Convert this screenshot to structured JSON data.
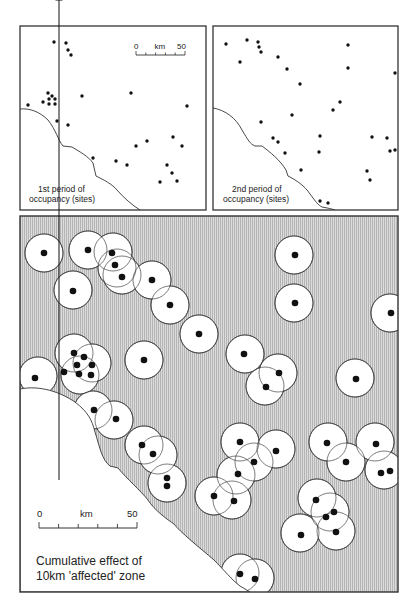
{
  "figure": {
    "panels": [
      {
        "id": "period1",
        "caption_line1": "1st period of",
        "caption_line2": "occupancy (sites)",
        "frame": {
          "x": 20,
          "y": 26,
          "w": 186,
          "h": 184
        },
        "scale_bar": {
          "start_label": "0",
          "unit_label": "km",
          "end_label": "50",
          "x1": 136,
          "x2": 185,
          "y": 55
        },
        "coastline": "M20,109 C30,108 40,112 48,120 C56,130 58,140 63,146 L72,147 C80,152 88,156 93,163 L96,176 C104,180 112,184 117,190 C124,198 132,205 140,210",
        "sites": [
          [
            54,
            42
          ],
          [
            66,
            43
          ],
          [
            68,
            50
          ],
          [
            71,
            55
          ],
          [
            48,
            93
          ],
          [
            52,
            96
          ],
          [
            43,
            102
          ],
          [
            49,
            99
          ],
          [
            49,
            104
          ],
          [
            55,
            99
          ],
          [
            55,
            104
          ],
          [
            28,
            105
          ],
          [
            82,
            96
          ],
          [
            131,
            93
          ],
          [
            187,
            106
          ],
          [
            57,
            121
          ],
          [
            68,
            125
          ],
          [
            136,
            146
          ],
          [
            147,
            141
          ],
          [
            173,
            137
          ],
          [
            182,
            146
          ],
          [
            93,
            158
          ],
          [
            116,
            161
          ],
          [
            127,
            165
          ],
          [
            167,
            165
          ],
          [
            172,
            173
          ],
          [
            177,
            181
          ],
          [
            160,
            182
          ]
        ]
      },
      {
        "id": "period2",
        "caption_line1": "2nd period of",
        "caption_line2": "occupancy (sites)",
        "frame": {
          "x": 213,
          "y": 26,
          "w": 185,
          "h": 184
        },
        "coastline": "M213,108 C225,110 236,118 242,130 C248,140 250,144 255,146 L262,146 C270,152 280,160 286,170 L288,176 C296,180 305,186 310,194 C316,202 318,205 322,207 C328,208 332,209 335,210",
        "sites": [
          [
            226,
            44
          ],
          [
            247,
            40
          ],
          [
            258,
            42
          ],
          [
            259,
            47
          ],
          [
            261,
            52
          ],
          [
            240,
            62
          ],
          [
            278,
            57
          ],
          [
            287,
            69
          ],
          [
            300,
            84
          ],
          [
            348,
            45
          ],
          [
            348,
            68
          ],
          [
            395,
            73
          ],
          [
            340,
            102
          ],
          [
            333,
            110
          ],
          [
            292,
            115
          ],
          [
            261,
            122
          ],
          [
            273,
            138
          ],
          [
            278,
            142
          ],
          [
            320,
            136
          ],
          [
            285,
            153
          ],
          [
            319,
            152
          ],
          [
            372,
            137
          ],
          [
            387,
            138
          ],
          [
            390,
            151
          ],
          [
            395,
            150
          ],
          [
            301,
            170
          ],
          [
            367,
            171
          ],
          [
            370,
            180
          ],
          [
            320,
            201
          ],
          [
            328,
            203
          ]
        ]
      }
    ],
    "cumulative_map": {
      "caption_line1": "Cumulative effect of",
      "caption_line2": "10km 'affected' zone",
      "frame": {
        "x": 20,
        "y": 216,
        "w": 378,
        "h": 376
      },
      "hatch_color": "#c9c9c9",
      "zone_radius": 19,
      "north_label": "N",
      "north_arrow": {
        "x": 59,
        "y1": 430,
        "y2": 480
      },
      "scale_bar": {
        "start_label": "0",
        "unit_label": "km",
        "end_label": "50",
        "x1": 39,
        "x2": 137,
        "y": 528
      },
      "land": "M20,389 C40,385 60,392 75,402 C88,412 92,420 95,432 C100,448 102,460 110,466 L118,468 C128,480 140,490 148,500 C154,510 168,520 174,524 C180,532 200,548 214,560 C224,570 232,580 240,586 L250,592 L20,592 Z",
      "zones": [
        {
          "c": [
            44,
            253
          ],
          "s": [
            [
              44,
              253
            ]
          ]
        },
        {
          "c": [
            88,
            250
          ],
          "s": [
            [
              88,
              250
            ]
          ]
        },
        {
          "c": [
            113,
            252
          ],
          "s": [
            [
              112,
              253
            ]
          ]
        },
        {
          "c": [
            117,
            268
          ],
          "s": [
            [
              115,
              265
            ]
          ]
        },
        {
          "c": [
            122,
            275
          ],
          "s": [
            [
              122,
              277
            ]
          ]
        },
        {
          "c": [
            73,
            290
          ],
          "s": [
            [
              73,
              291
            ]
          ]
        },
        {
          "c": [
            152,
            280
          ],
          "s": [
            [
              152,
              280
            ]
          ]
        },
        {
          "c": [
            170,
            305
          ],
          "s": [
            [
              170,
              305
            ]
          ]
        },
        {
          "c": [
            199,
            334
          ],
          "s": [
            [
              199,
              334
            ]
          ]
        },
        {
          "c": [
            294,
            255
          ],
          "s": [
            [
              295,
              255
            ]
          ]
        },
        {
          "c": [
            294,
            303
          ],
          "s": [
            [
              295,
              303
            ]
          ]
        },
        {
          "c": [
            390,
            313
          ],
          "s": [
            [
              391,
              313
            ]
          ]
        },
        {
          "c": [
            74,
            353
          ],
          "s": [
            [
              74,
              353
            ]
          ]
        },
        {
          "c": [
            92,
            363
          ],
          "s": [
            [
              84,
              357
            ],
            [
              77,
              365
            ],
            [
              92,
              365
            ],
            [
              79,
              374
            ],
            [
              91,
              375
            ]
          ]
        },
        {
          "c": [
            80,
            375
          ],
          "s": [
            [
              64,
              372
            ]
          ]
        },
        {
          "c": [
            38,
            376
          ],
          "s": [
            [
              35,
              378
            ]
          ]
        },
        {
          "c": [
            144,
            360
          ],
          "s": [
            [
              144,
              360
            ]
          ]
        },
        {
          "c": [
            245,
            354
          ],
          "s": [
            [
              244,
              354
            ]
          ]
        },
        {
          "c": [
            278,
            373
          ],
          "s": [
            [
              279,
              373
            ]
          ]
        },
        {
          "c": [
            265,
            386
          ],
          "s": [
            [
              266,
              387
            ]
          ]
        },
        {
          "c": [
            355,
            378
          ],
          "s": [
            [
              356,
              379
            ]
          ]
        },
        {
          "c": [
            93,
            410
          ],
          "s": [
            [
              94,
              410
            ]
          ]
        },
        {
          "c": [
            114,
            420
          ],
          "s": [
            [
              116,
              419
            ]
          ]
        },
        {
          "c": [
            144,
            445
          ],
          "s": [
            [
              142,
              445
            ]
          ]
        },
        {
          "c": [
            158,
            455
          ],
          "s": [
            [
              153,
              454
            ]
          ]
        },
        {
          "c": [
            167,
            483
          ],
          "s": [
            [
              167,
              478
            ],
            [
              167,
              486
            ]
          ]
        },
        {
          "c": [
            240,
            442
          ],
          "s": [
            [
              240,
              442
            ]
          ]
        },
        {
          "c": [
            276,
            449
          ],
          "s": [
            [
              276,
              451
            ]
          ]
        },
        {
          "c": [
            254,
            462
          ],
          "s": [
            [
              254,
              462
            ]
          ]
        },
        {
          "c": [
            236,
            475
          ],
          "s": [
            [
              238,
              474
            ]
          ]
        },
        {
          "c": [
            214,
            496
          ],
          "s": [
            [
              214,
              496
            ]
          ]
        },
        {
          "c": [
            232,
            500
          ],
          "s": [
            [
              234,
              501
            ]
          ]
        },
        {
          "c": [
            328,
            442
          ],
          "s": [
            [
              327,
              443
            ]
          ]
        },
        {
          "c": [
            375,
            442
          ],
          "s": [
            [
              376,
              444
            ]
          ]
        },
        {
          "c": [
            346,
            462
          ],
          "s": [
            [
              346,
              462
            ]
          ]
        },
        {
          "c": [
            384,
            470
          ],
          "s": [
            [
              381,
              473
            ],
            [
              390,
              471
            ]
          ]
        },
        {
          "c": [
            317,
            498
          ],
          "s": [
            [
              316,
              500
            ]
          ]
        },
        {
          "c": [
            330,
            512
          ],
          "s": [
            [
              326,
              517
            ],
            [
              334,
              512
            ]
          ]
        },
        {
          "c": [
            300,
            533
          ],
          "s": [
            [
              301,
              535
            ]
          ]
        },
        {
          "c": [
            336,
            531
          ],
          "s": [
            [
              336,
              532
            ]
          ]
        },
        {
          "c": [
            240,
            573
          ],
          "s": [
            [
              240,
              574
            ]
          ]
        },
        {
          "c": [
            255,
            578
          ],
          "s": [
            [
              255,
              579
            ]
          ]
        }
      ]
    }
  }
}
